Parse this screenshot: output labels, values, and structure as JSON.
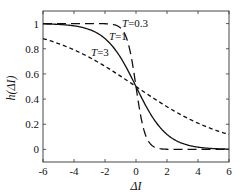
{
  "chart_data": {
    "type": "line",
    "title": "",
    "xlabel": "ΔI",
    "ylabel": "h(ΔI)",
    "xlim": [
      -6,
      6
    ],
    "ylim": [
      -0.1,
      1.1
    ],
    "xticks": [
      -6,
      -4,
      -2,
      0,
      2,
      4,
      6
    ],
    "xtick_labels": [
      "-6",
      "-4",
      "-2",
      "0",
      "2",
      "4",
      "6"
    ],
    "yticks": [
      0,
      0.2,
      0.4,
      0.6,
      0.8,
      1
    ],
    "ytick_labels": [
      "0",
      "0.2",
      "0.4",
      "0.6",
      "0.8",
      "1"
    ],
    "grid": false,
    "legend": "inline labels",
    "x": [
      -6,
      -5,
      -4,
      -3,
      -2,
      -1.5,
      -1,
      -0.5,
      0,
      0.5,
      1,
      1.5,
      2,
      3,
      4,
      5,
      6
    ],
    "series": [
      {
        "name": "T=0.3",
        "style": "long-dash",
        "values": [
          1.0,
          1.0,
          1.0,
          1.0,
          0.999,
          0.993,
          0.966,
          0.841,
          0.5,
          0.159,
          0.034,
          0.007,
          0.001,
          0.0,
          0.0,
          0.0,
          0.0
        ]
      },
      {
        "name": "T=1",
        "style": "solid",
        "values": [
          0.998,
          0.993,
          0.982,
          0.953,
          0.881,
          0.818,
          0.731,
          0.622,
          0.5,
          0.378,
          0.269,
          0.182,
          0.119,
          0.047,
          0.018,
          0.007,
          0.002
        ]
      },
      {
        "name": "T=3",
        "style": "short-dash",
        "values": [
          0.881,
          0.841,
          0.792,
          0.731,
          0.661,
          0.622,
          0.583,
          0.542,
          0.5,
          0.458,
          0.417,
          0.378,
          0.339,
          0.269,
          0.208,
          0.159,
          0.119
        ]
      }
    ],
    "annotations": [
      {
        "text": "T=0.3",
        "x": -0.8,
        "y": 1.0
      },
      {
        "text": "T=1",
        "x": -1.5,
        "y": 0.9
      },
      {
        "text": "T=3",
        "x": -3.0,
        "y": 0.78
      }
    ]
  }
}
